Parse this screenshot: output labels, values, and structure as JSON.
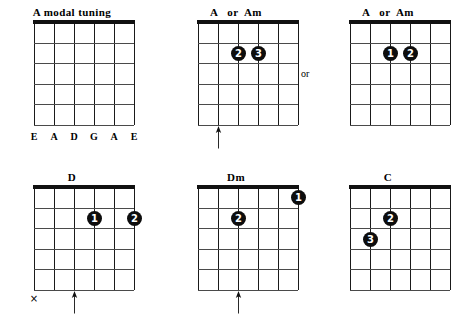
{
  "page": {
    "width": 467,
    "height": 329,
    "background": "#ffffff",
    "ink": "#111111"
  },
  "connector": {
    "or_label": "or"
  },
  "glyphs": {
    "mute": "×"
  },
  "diagrams": [
    {
      "id": "a-modal-tuning",
      "title": "A modal tuning",
      "strings": 6,
      "frets": 5,
      "has_nut": true,
      "string_labels": [
        "E",
        "A",
        "D",
        "G",
        "A",
        "E"
      ],
      "dots": [],
      "mutes": [],
      "arrows": []
    },
    {
      "id": "a-or-am-1",
      "title": "A   or  Am",
      "strings": 6,
      "frets": 5,
      "has_nut": true,
      "string_labels": [],
      "dots": [
        {
          "finger": "2",
          "string": 3,
          "fret": 2
        },
        {
          "finger": "3",
          "string": 4,
          "fret": 2
        }
      ],
      "mutes": [],
      "arrows": [
        {
          "string": 2
        }
      ]
    },
    {
      "id": "a-or-am-2",
      "title": "A   or  Am",
      "strings": 6,
      "frets": 5,
      "has_nut": true,
      "string_labels": [],
      "dots": [
        {
          "finger": "1",
          "string": 3,
          "fret": 2
        },
        {
          "finger": "2",
          "string": 4,
          "fret": 2
        }
      ],
      "mutes": [],
      "arrows": []
    },
    {
      "id": "d",
      "title": "D",
      "strings": 6,
      "frets": 5,
      "has_nut": true,
      "string_labels": [],
      "dots": [
        {
          "finger": "1",
          "string": 4,
          "fret": 2
        },
        {
          "finger": "2",
          "string": 6,
          "fret": 2
        }
      ],
      "mutes": [
        {
          "string": 1
        }
      ],
      "arrows": [
        {
          "string": 3
        }
      ]
    },
    {
      "id": "dm",
      "title": "Dm",
      "strings": 6,
      "frets": 5,
      "has_nut": true,
      "string_labels": [],
      "dots": [
        {
          "finger": "1",
          "string": 6,
          "fret": 1
        },
        {
          "finger": "2",
          "string": 3,
          "fret": 2
        }
      ],
      "mutes": [],
      "arrows": [
        {
          "string": 3
        }
      ]
    },
    {
      "id": "c",
      "title": "C",
      "strings": 6,
      "frets": 5,
      "has_nut": true,
      "string_labels": [],
      "dots": [
        {
          "finger": "2",
          "string": 3,
          "fret": 2
        },
        {
          "finger": "3",
          "string": 2,
          "fret": 3
        }
      ],
      "mutes": [],
      "arrows": []
    }
  ],
  "layout": {
    "positions": [
      {
        "left": 2,
        "top": 6
      },
      {
        "left": 166,
        "top": 6
      },
      {
        "left": 318,
        "top": 6
      },
      {
        "left": 2,
        "top": 171
      },
      {
        "left": 166,
        "top": 171
      },
      {
        "left": 318,
        "top": 171
      }
    ],
    "or_position": {
      "left": 301,
      "top": 68
    }
  }
}
